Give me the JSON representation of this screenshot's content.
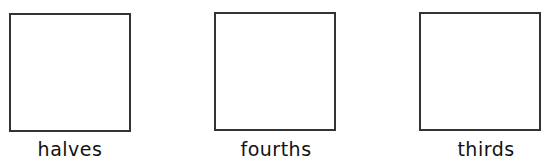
{
  "figures": [
    {
      "label": "halves",
      "shape": "square"
    },
    {
      "label": "fourths",
      "shape": "square"
    },
    {
      "label": "thirds",
      "shape": "square"
    }
  ],
  "colors": {
    "outline": "#333333",
    "background": "#ffffff",
    "text": "#111111"
  }
}
